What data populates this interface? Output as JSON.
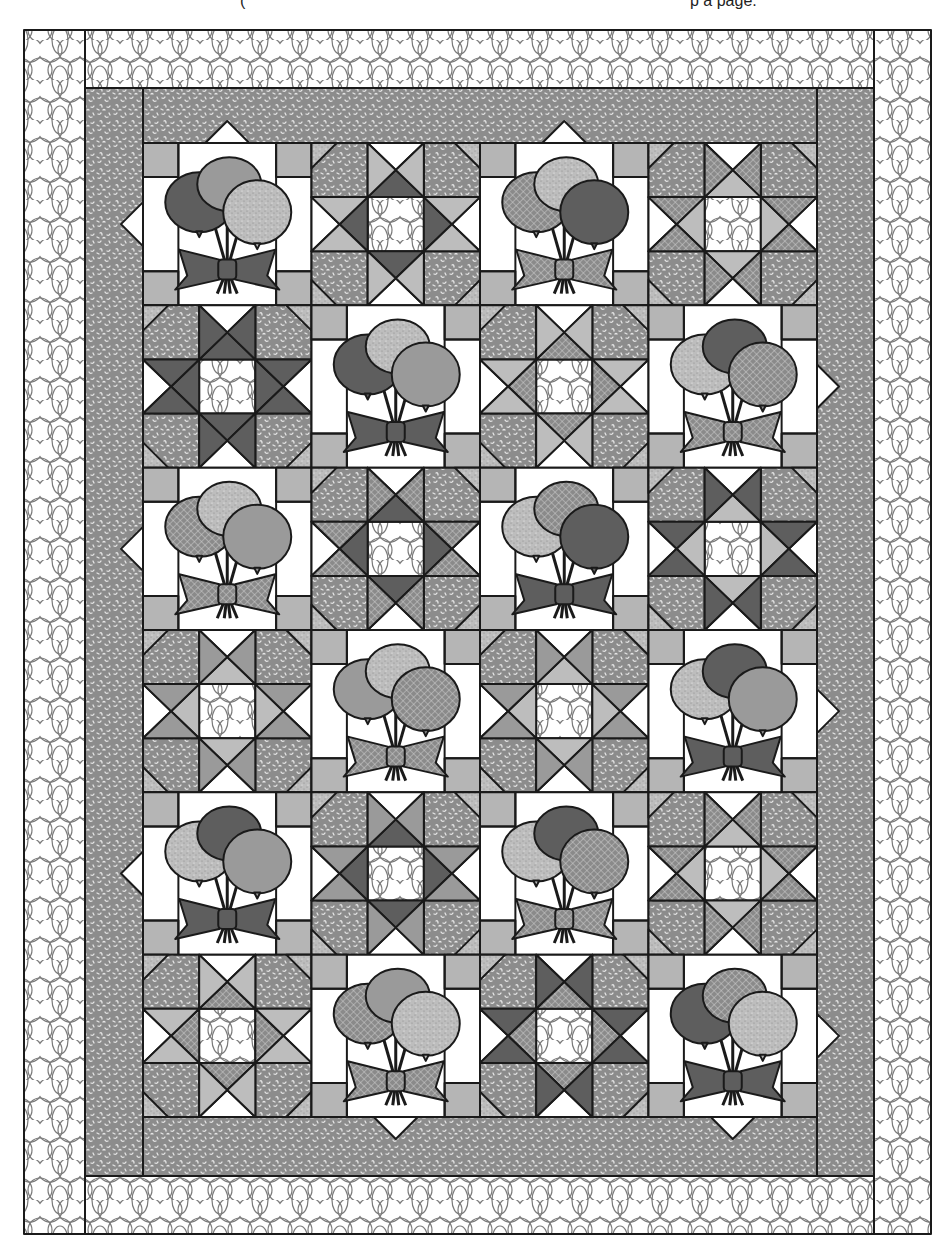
{
  "caption_fragments": [
    {
      "text": "(",
      "x": 240
    },
    {
      "text": "p   a   page.",
      "x": 690
    }
  ],
  "colors": {
    "outline": "#1a1a1a",
    "white": "#ffffff",
    "light_gray": "#bdbdbd",
    "medium_gray": "#9a9a9a",
    "dark_gray": "#5e5e5e",
    "border_mottled": "#8c8c8c",
    "swirl_line": "#7a7a7a",
    "corner_square": "#b5b5b5"
  },
  "layout": {
    "outer_border": {
      "x": 24,
      "y": 30,
      "w": 907,
      "h": 1204,
      "width": 60
    },
    "inner_border": {
      "x": 85,
      "y": 88,
      "w": 789,
      "h": 1088
    },
    "blocks_area": {
      "x": 143,
      "y": 143,
      "w": 674,
      "h": 974
    },
    "cols": 4,
    "rows": 6
  },
  "quilt": {
    "name": "Balloon and Star Quilt",
    "blocks": [
      [
        {
          "type": "balloon",
          "fills": [
            "dark",
            "medium",
            "speckle"
          ]
        },
        {
          "type": "star",
          "outer": "light",
          "inner": "dark"
        },
        {
          "type": "balloon",
          "fills": [
            "check",
            "speckle",
            "dark"
          ]
        },
        {
          "type": "star",
          "outer": "check",
          "inner": "light"
        }
      ],
      [
        {
          "type": "star",
          "outer": "dark",
          "inner": "dark"
        },
        {
          "type": "balloon",
          "fills": [
            "dark",
            "speckle",
            "medium"
          ]
        },
        {
          "type": "star",
          "outer": "light",
          "inner": "check"
        },
        {
          "type": "balloon",
          "fills": [
            "speckle",
            "dark",
            "check"
          ]
        }
      ],
      [
        {
          "type": "balloon",
          "fills": [
            "check",
            "speckle",
            "medium"
          ]
        },
        {
          "type": "star",
          "outer": "check",
          "inner": "dark"
        },
        {
          "type": "balloon",
          "fills": [
            "speckle",
            "check",
            "dark"
          ]
        },
        {
          "type": "star",
          "outer": "dark",
          "inner": "light"
        }
      ],
      [
        {
          "type": "star",
          "outer": "medium",
          "inner": "light"
        },
        {
          "type": "balloon",
          "fills": [
            "medium",
            "speckle",
            "check"
          ]
        },
        {
          "type": "star",
          "outer": "medium",
          "inner": "light"
        },
        {
          "type": "balloon",
          "fills": [
            "speckle",
            "dark",
            "medium"
          ]
        }
      ],
      [
        {
          "type": "balloon",
          "fills": [
            "speckle",
            "dark",
            "medium"
          ]
        },
        {
          "type": "star",
          "outer": "medium",
          "inner": "dark"
        },
        {
          "type": "balloon",
          "fills": [
            "speckle",
            "dark",
            "check"
          ]
        },
        {
          "type": "star",
          "outer": "check",
          "inner": "light"
        }
      ],
      [
        {
          "type": "star",
          "outer": "light",
          "inner": "check"
        },
        {
          "type": "balloon",
          "fills": [
            "check",
            "medium",
            "speckle"
          ]
        },
        {
          "type": "star",
          "outer": "dark",
          "inner": "check"
        },
        {
          "type": "balloon",
          "fills": [
            "dark",
            "check",
            "speckle"
          ]
        }
      ]
    ]
  }
}
